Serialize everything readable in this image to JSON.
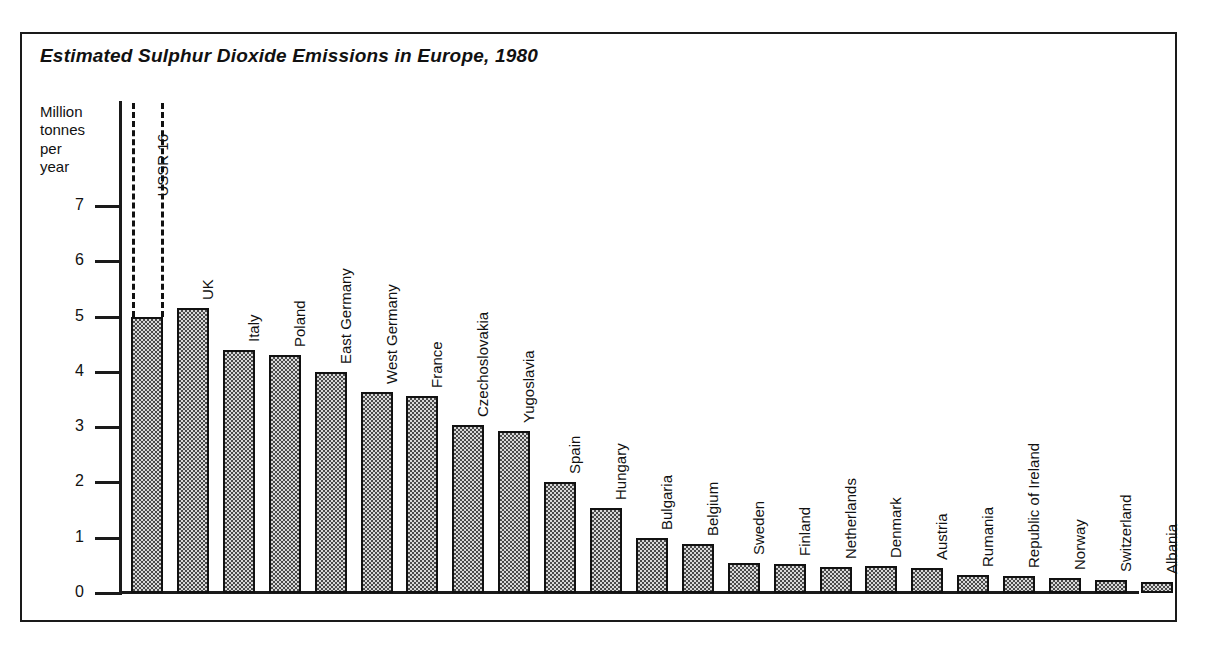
{
  "figure": {
    "title": "Estimated Sulphur Dioxide Emissions in Europe, 1980",
    "y_axis_title_lines": [
      "Million",
      "tonnes",
      "per",
      "year"
    ]
  },
  "chart_data": {
    "type": "bar",
    "title": "Estimated Sulphur Dioxide Emissions in Europe, 1980",
    "xlabel": "",
    "ylabel": "Million tonnes per year",
    "ylim": [
      0,
      7
    ],
    "yticks": [
      0,
      1,
      2,
      3,
      4,
      5,
      6,
      7
    ],
    "ytick_labels": [
      "0",
      "1",
      "2",
      "3",
      "4",
      "5",
      "6",
      "7"
    ],
    "grid": false,
    "legend": "none",
    "note": "USSR bar is truncated; its true value is 16 million tonnes per year, shown by dashed lines above the axis maximum.",
    "categories": [
      "USSR",
      "UK",
      "Italy",
      "Poland",
      "East Germany",
      "West Germany",
      "France",
      "Czechoslovakia",
      "Yugoslavia",
      "Spain",
      "Hungary",
      "Bulgaria",
      "Belgium",
      "Sweden",
      "Finland",
      "Netherlands",
      "Denmark",
      "Austria",
      "Rumania",
      "Republic of Ireland",
      "Norway",
      "Switzerland",
      "Albania"
    ],
    "values": [
      16.0,
      5.15,
      4.4,
      4.3,
      4.0,
      3.63,
      3.57,
      3.03,
      2.93,
      2.0,
      1.53,
      1.0,
      0.88,
      0.55,
      0.53,
      0.47,
      0.48,
      0.45,
      0.33,
      0.3,
      0.28,
      0.23,
      0.2
    ],
    "displayed_values": [
      5.0,
      5.15,
      4.4,
      4.3,
      4.0,
      3.63,
      3.57,
      3.03,
      2.93,
      2.0,
      1.53,
      1.0,
      0.88,
      0.55,
      0.53,
      0.47,
      0.48,
      0.45,
      0.33,
      0.3,
      0.28,
      0.23,
      0.2
    ],
    "truncated_bar": {
      "category": "USSR",
      "label": "USSR 16",
      "value": 16
    }
  },
  "style": {
    "bar_fill": "#d8d8d8",
    "bar_pattern": "#4a4a4a",
    "line_color": "#111111",
    "background": "#ffffff"
  }
}
